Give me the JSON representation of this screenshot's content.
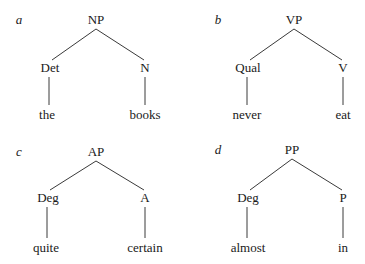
{
  "trees": [
    {
      "label": "a",
      "root": "NP",
      "children": [
        {
          "category": "Det",
          "word": "the"
        },
        {
          "category": "N",
          "word": "books"
        }
      ]
    },
    {
      "label": "b",
      "root": "VP",
      "children": [
        {
          "category": "Qual",
          "word": "never"
        },
        {
          "category": "V",
          "word": "eat"
        }
      ]
    },
    {
      "label": "c",
      "root": "AP",
      "children": [
        {
          "category": "Deg",
          "word": "quite"
        },
        {
          "category": "A",
          "word": "certain"
        }
      ]
    },
    {
      "label": "d",
      "root": "PP",
      "children": [
        {
          "category": "Deg",
          "word": "almost"
        },
        {
          "category": "P",
          "word": "in"
        }
      ]
    }
  ]
}
